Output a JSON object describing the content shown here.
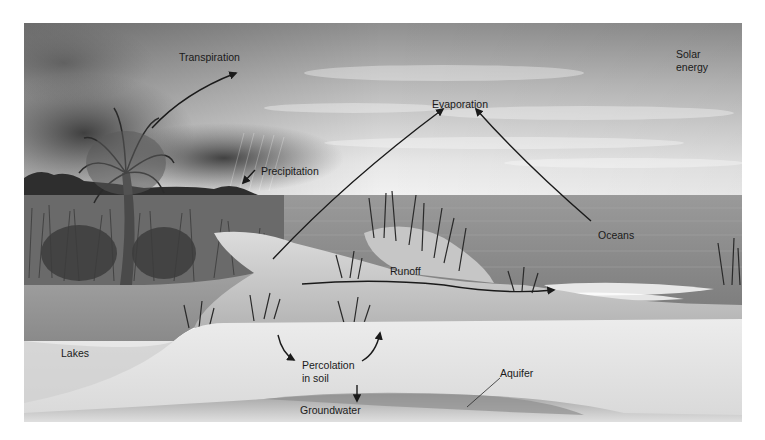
{
  "figure": {
    "style": "grayscale illustration"
  },
  "labels": {
    "transpiration": "Transpiration",
    "solar_energy": "Solar\nenergy",
    "evaporation": "Evaporation",
    "precipitation": "Precipitation",
    "oceans": "Oceans",
    "runoff": "Runoff",
    "lakes": "Lakes",
    "percolation": "Percolation\nin soil",
    "aquifer": "Aquifer",
    "groundwater": "Groundwater"
  },
  "arrows": [
    {
      "from": "palm-tree",
      "to": "Transpiration",
      "direction": "up-right"
    },
    {
      "from": "Precipitation",
      "to": "shoreline",
      "direction": "down-left"
    },
    {
      "from": "land",
      "to": "Evaporation",
      "direction": "up-right"
    },
    {
      "from": "Oceans",
      "to": "Evaporation",
      "direction": "up-left"
    },
    {
      "from": "land",
      "to": "ocean-surf",
      "label": "Runoff",
      "direction": "right"
    },
    {
      "from": "surface",
      "to": "Percolation in soil",
      "direction": "down"
    },
    {
      "from": "Percolation in soil",
      "to": "surface",
      "direction": "up"
    },
    {
      "from": "Percolation in soil",
      "to": "Groundwater",
      "direction": "down"
    }
  ],
  "colors": {
    "sky_top": "#8a8a8a",
    "sky_light": "#e6e6e6",
    "ocean": "#8c8c8c",
    "sand": "#d2d2d2",
    "soil": "#e4e4e4",
    "groundwater": "#9a9a9a",
    "arrow": "#1a1a1a"
  }
}
